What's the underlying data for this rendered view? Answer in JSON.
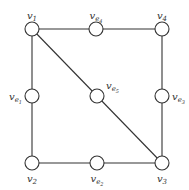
{
  "diagram": {
    "type": "graph",
    "nodes": [
      {
        "id": "v1",
        "base": "v",
        "sub": "1",
        "subsub": ""
      },
      {
        "id": "ve4",
        "base": "v",
        "sub": "e",
        "subsub": "4"
      },
      {
        "id": "v4",
        "base": "v",
        "sub": "4",
        "subsub": ""
      },
      {
        "id": "ve1",
        "base": "v",
        "sub": "e",
        "subsub": "1"
      },
      {
        "id": "ve5",
        "base": "v",
        "sub": "e",
        "subsub": "5"
      },
      {
        "id": "ve3",
        "base": "v",
        "sub": "e",
        "subsub": "3"
      },
      {
        "id": "v2",
        "base": "v",
        "sub": "2",
        "subsub": ""
      },
      {
        "id": "ve2",
        "base": "v",
        "sub": "e",
        "subsub": "2"
      },
      {
        "id": "v3",
        "base": "v",
        "sub": "3",
        "subsub": ""
      }
    ],
    "edges": [
      [
        "v1",
        "ve4"
      ],
      [
        "ve4",
        "v4"
      ],
      [
        "v4",
        "ve3"
      ],
      [
        "ve3",
        "v3"
      ],
      [
        "v1",
        "ve1"
      ],
      [
        "ve1",
        "v2"
      ],
      [
        "v2",
        "ve2"
      ],
      [
        "ve2",
        "v3"
      ],
      [
        "v1",
        "ve5"
      ],
      [
        "ve5",
        "v3"
      ]
    ]
  }
}
